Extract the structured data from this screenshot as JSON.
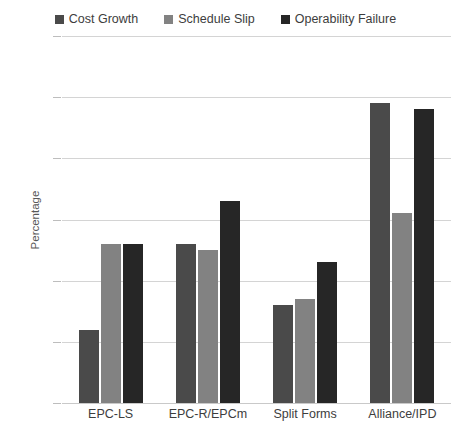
{
  "chart_data": {
    "type": "bar",
    "title": "",
    "xlabel": "",
    "ylabel": "Percentage",
    "ylim": [
      0,
      60
    ],
    "ytick_step": 10,
    "ytick_labels": [
      "0%",
      "10%",
      "20%",
      "30%",
      "40%",
      "50%",
      "60%"
    ],
    "ytick_values": [
      0,
      10,
      20,
      30,
      40,
      50,
      60
    ],
    "grid": true,
    "legend_position": "top-center",
    "categories": [
      "EPC-LS",
      "EPC-R/EPCm",
      "Split Forms",
      "Alliance/IPD"
    ],
    "series": [
      {
        "name": "Cost Growth",
        "color": "#4a4a4a",
        "values": [
          12,
          26,
          16,
          49
        ]
      },
      {
        "name": "Schedule Slip",
        "color": "#828282",
        "values": [
          26,
          25,
          17,
          31
        ]
      },
      {
        "name": "Operability Failure",
        "color": "#262626",
        "values": [
          26,
          33,
          23,
          48
        ]
      }
    ]
  },
  "colors": {
    "background": "#ffffff",
    "gridline": "#d4d4d4",
    "axis_text": "#585858",
    "label_text": "#3d3d3d",
    "cost_growth": "#4a4a4a",
    "schedule_slip": "#828282",
    "operability_failure": "#262626"
  }
}
